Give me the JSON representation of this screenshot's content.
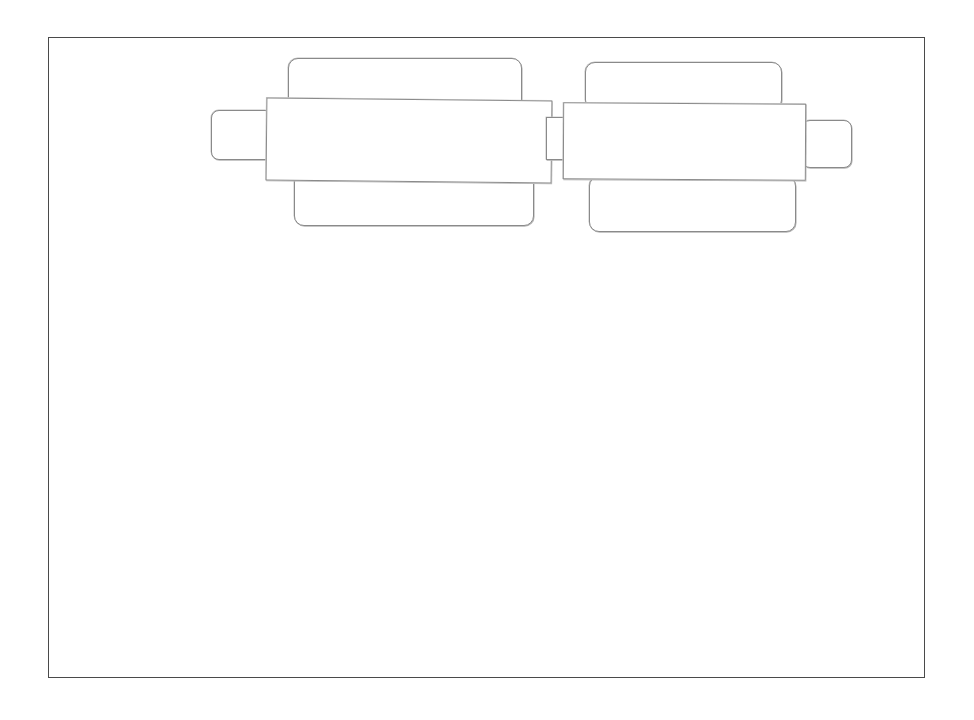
{
  "canvas": {
    "background": "#ffffff",
    "frame_color": "#4a4a4a",
    "stroke_color": "#8a8a8a"
  },
  "wireframe": {
    "description": "Hand-drawn sketch of two side-by-side carousel/slider widgets, no text",
    "carousels": [
      {
        "id": "left",
        "elements": [
          "back-card-top",
          "main-card",
          "back-card-bottom",
          "left-nav-tab",
          "connector"
        ]
      },
      {
        "id": "right",
        "elements": [
          "back-card-top",
          "main-card",
          "back-card-bottom",
          "right-nav-tab"
        ]
      }
    ]
  }
}
